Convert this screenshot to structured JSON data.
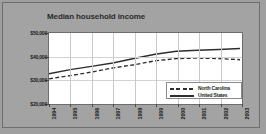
{
  "frame": {
    "background_color": "#a3a3a3",
    "border_color": "#6e6e6e"
  },
  "title": "Median household income",
  "legend": {
    "position": "inside-bottom-right",
    "entries": [
      {
        "label": "North Carolina",
        "style": "dashed",
        "color": "#2e2e2e"
      },
      {
        "label": "United States",
        "style": "solid",
        "color": "#2e2e2e"
      }
    ]
  },
  "axes": {
    "y_ticks": [
      "$20,000",
      "$30,000",
      "$40,000",
      "$50,000"
    ],
    "y_tick_values": [
      20000,
      30000,
      40000,
      50000
    ],
    "x_ticks": [
      "1994",
      "1995",
      "1996",
      "1997",
      "1998",
      "1999",
      "2000",
      "2001",
      "2002",
      "2003"
    ]
  },
  "chart_data": {
    "type": "line",
    "title": "Median household income",
    "xlabel": "",
    "ylabel": "",
    "x": [
      1994,
      1995,
      1996,
      1997,
      1998,
      1999,
      2000,
      2001,
      2002,
      2003
    ],
    "categories": [
      "1994",
      "1995",
      "1996",
      "1997",
      "1998",
      "1999",
      "2000",
      "2001",
      "2002",
      "2003"
    ],
    "series": [
      {
        "name": "United States",
        "style": "solid",
        "color": "#2e2e2e",
        "values": [
          32300,
          34100,
          35500,
          37000,
          38900,
          40800,
          42100,
          42500,
          42800,
          43300
        ]
      },
      {
        "name": "North Carolina",
        "style": "dashed",
        "color": "#2e2e2e",
        "values": [
          30100,
          31500,
          33000,
          34800,
          36200,
          37900,
          38900,
          39100,
          38900,
          38400
        ]
      }
    ],
    "ylim": [
      20000,
      50000
    ],
    "xlim": [
      1994,
      2003
    ],
    "grid": true,
    "grid_x": true,
    "grid_y": true,
    "legend_position": "inside-bottom-right"
  }
}
